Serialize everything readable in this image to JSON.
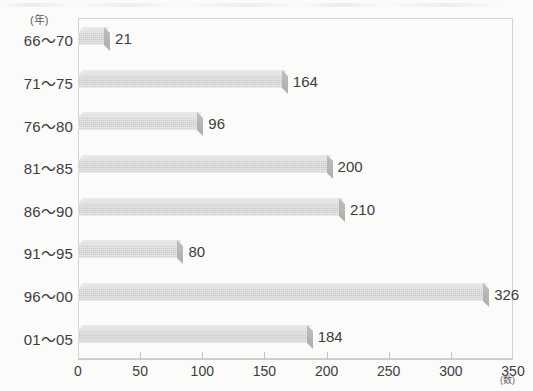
{
  "chart_data": {
    "type": "bar",
    "orientation": "horizontal",
    "title": "",
    "xlabel": "(数)",
    "ylabel": "(年)",
    "categories": [
      "66〜70",
      "71〜75",
      "76〜80",
      "81〜85",
      "86〜90",
      "91〜95",
      "96〜00",
      "01〜05"
    ],
    "values": [
      21,
      164,
      96,
      200,
      210,
      80,
      326,
      184
    ],
    "value_labels": [
      "21",
      "164",
      "96",
      "200",
      "210",
      "80",
      "326",
      "184"
    ],
    "xlim": [
      0,
      350
    ],
    "xticks": [
      0,
      50,
      100,
      150,
      200,
      250,
      300,
      350
    ],
    "xtick_labels": [
      "0",
      "50",
      "100",
      "150",
      "200",
      "250",
      "300",
      "350"
    ],
    "grid": false,
    "legend": false,
    "style": "3d-bar",
    "colors": {
      "bar_face": "#cbcbcb",
      "bar_top": "#e4e4e4",
      "bar_cap": "#b4b4b4",
      "frame": "#d2d2d2",
      "axis": "#c9c9c9",
      "text": "#3d3d3d",
      "background": "#fbfbfa"
    }
  },
  "axes": {
    "y_unit": "(年)",
    "x_unit": "(数)"
  }
}
